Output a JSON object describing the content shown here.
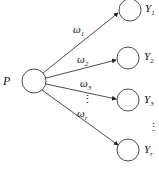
{
  "diagram": {
    "source": {
      "label": "P"
    },
    "targets": [
      {
        "label": "Y",
        "sub": "1"
      },
      {
        "label": "Y",
        "sub": "2"
      },
      {
        "label": "Y",
        "sub": "3"
      },
      {
        "label": "Y",
        "sub": "r"
      }
    ],
    "weights": [
      {
        "label": "ω",
        "sub": "1"
      },
      {
        "label": "ω",
        "sub": "2"
      },
      {
        "label": "ω",
        "sub": "3"
      },
      {
        "label": "ω",
        "sub": "r"
      }
    ],
    "ellipsis": "⋮"
  }
}
